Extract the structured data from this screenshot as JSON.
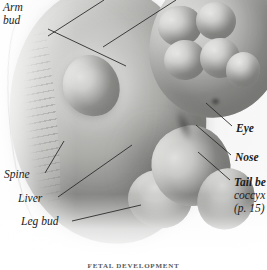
{
  "figure": {
    "caption": "FETAL DEVELOPMENT",
    "background_color": "#fbfbfb",
    "leader_line_color": "#2c2c2c",
    "tissue_tone": "#c2c2c0"
  },
  "labels": {
    "left": [
      {
        "id": "arm-bud",
        "line1": "Arm",
        "line2": "bud"
      },
      {
        "id": "spine",
        "line1": "Spine",
        "line2": ""
      },
      {
        "id": "liver",
        "line1": "Liver",
        "line2": ""
      },
      {
        "id": "leg-bud",
        "line1": "Leg bud",
        "line2": ""
      }
    ],
    "right": [
      {
        "id": "eye",
        "line1": "Eye",
        "line2": "",
        "line3": ""
      },
      {
        "id": "nose",
        "line1": "Nose",
        "line2": "",
        "line3": ""
      },
      {
        "id": "tail",
        "line1": "Tail be",
        "line2": "coccyx",
        "line3": "(p. 15)"
      }
    ]
  },
  "anatomy": {
    "arm_bud": "arm bud",
    "leg_bud": "leg bud",
    "spine": "spine / somites",
    "liver": "liver",
    "eye": "eye",
    "nose": "nose",
    "tail": "tail bud becoming coccyx",
    "head": "head",
    "body": "embryo body"
  }
}
